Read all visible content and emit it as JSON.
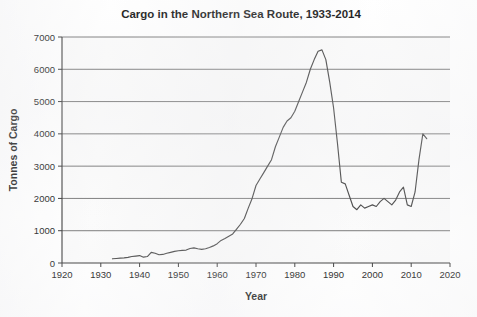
{
  "chart_data": {
    "type": "line",
    "title": "Cargo in the  Northern Sea Route, 1933-2014",
    "xlabel": "Year",
    "ylabel": "Tonnes of Cargo",
    "xlim": [
      1920,
      2020
    ],
    "ylim": [
      0,
      7000
    ],
    "grid": true,
    "legend": "none",
    "x_ticks": [
      "1920",
      "1930",
      "1940",
      "1950",
      "1960",
      "1970",
      "1980",
      "1990",
      "2000",
      "2010",
      "2020"
    ],
    "x_tick_values": [
      1920,
      1930,
      1940,
      1950,
      1960,
      1970,
      1980,
      1990,
      2000,
      2010,
      2020
    ],
    "y_ticks": [
      "0",
      "1000",
      "2000",
      "3000",
      "4000",
      "5000",
      "6000",
      "7000"
    ],
    "y_tick_values": [
      0,
      1000,
      2000,
      3000,
      4000,
      5000,
      6000,
      7000
    ],
    "series": [
      {
        "name": "Cargo",
        "color": "#4a4a4a",
        "x": [
          1933,
          1934,
          1935,
          1936,
          1937,
          1938,
          1939,
          1940,
          1941,
          1942,
          1943,
          1944,
          1945,
          1946,
          1947,
          1948,
          1949,
          1950,
          1951,
          1952,
          1953,
          1954,
          1955,
          1956,
          1957,
          1958,
          1959,
          1960,
          1961,
          1962,
          1963,
          1964,
          1965,
          1966,
          1967,
          1968,
          1969,
          1970,
          1971,
          1972,
          1973,
          1974,
          1975,
          1976,
          1977,
          1978,
          1979,
          1980,
          1981,
          1982,
          1983,
          1984,
          1985,
          1986,
          1987,
          1988,
          1989,
          1990,
          1991,
          1992,
          1993,
          1994,
          1995,
          1996,
          1997,
          1998,
          1999,
          2000,
          2001,
          2002,
          2003,
          2004,
          2005,
          2006,
          2007,
          2008,
          2009,
          2010,
          2011,
          2012,
          2013,
          2014
        ],
        "values": [
          130,
          140,
          150,
          160,
          175,
          200,
          215,
          230,
          180,
          200,
          330,
          300,
          255,
          265,
          300,
          330,
          360,
          380,
          390,
          400,
          450,
          470,
          440,
          420,
          440,
          480,
          530,
          600,
          700,
          760,
          830,
          900,
          1050,
          1200,
          1380,
          1700,
          2000,
          2400,
          2600,
          2800,
          3000,
          3200,
          3600,
          3900,
          4200,
          4400,
          4500,
          4700,
          5000,
          5300,
          5600,
          6000,
          6300,
          6560,
          6600,
          6300,
          5600,
          4800,
          3700,
          2500,
          2450,
          2100,
          1750,
          1650,
          1800,
          1700,
          1750,
          1800,
          1750,
          1900,
          2000,
          1900,
          1800,
          1950,
          2200,
          2350,
          1800,
          1750,
          2200,
          3200,
          4000,
          3850
        ]
      }
    ]
  },
  "figure": {
    "width": 477,
    "height": 317,
    "plot": {
      "left": 62,
      "right": 450,
      "top": 37,
      "bottom": 263
    },
    "title_pos": {
      "x": 241,
      "y": 18
    },
    "xlabel_pos": {
      "x": 256,
      "y": 300
    },
    "ylabel_pos": {
      "x": 17,
      "y": 150
    },
    "colors": {
      "line": "#4a4a4a",
      "grid": "#6e6e6e",
      "axis": "#3a3a3a",
      "text": "#1b1b1b",
      "background": "#ffffff"
    }
  }
}
